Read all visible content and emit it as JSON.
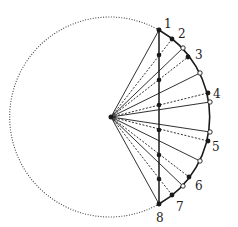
{
  "diagram": {
    "center": {
      "x": 111,
      "y": 117
    },
    "radius": 100,
    "chord_x": 159,
    "colors": {
      "stroke": "#1a1a1a",
      "dotted": "#444444",
      "open_fill": "#ffffff"
    },
    "numbered_points": [
      {
        "label": "1",
        "x": 159,
        "y": 30,
        "lx": 164,
        "ly": 24
      },
      {
        "label": "2",
        "x": 172,
        "y": 39,
        "lx": 178,
        "ly": 34
      },
      {
        "label": "3",
        "x": 188,
        "y": 57,
        "lx": 195,
        "ly": 55
      },
      {
        "label": "4",
        "x": 208,
        "y": 93,
        "lx": 213,
        "ly": 94
      },
      {
        "label": "5",
        "x": 208,
        "y": 141,
        "lx": 212,
        "ly": 147
      },
      {
        "label": "6",
        "x": 189,
        "y": 177,
        "lx": 195,
        "ly": 186
      },
      {
        "label": "7",
        "x": 172,
        "y": 195,
        "lx": 176,
        "ly": 207
      },
      {
        "label": "8",
        "x": 159,
        "y": 204,
        "lx": 156,
        "ly": 218
      }
    ],
    "chord_dots_y": [
      30,
      55,
      80,
      105,
      130,
      155,
      179,
      204
    ],
    "open_points": [
      {
        "x": 183,
        "y": 48
      },
      {
        "x": 200,
        "y": 73
      },
      {
        "x": 210,
        "y": 102
      },
      {
        "x": 210,
        "y": 132
      },
      {
        "x": 200,
        "y": 161
      },
      {
        "x": 183,
        "y": 186
      }
    ]
  }
}
